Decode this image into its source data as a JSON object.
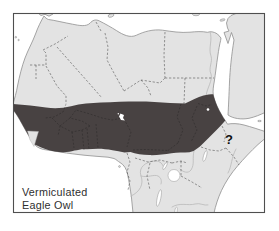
{
  "figure": {
    "species_label": {
      "line1": "Vermiculated",
      "line2": "Eagle Owl"
    },
    "uncertain_marker": "?"
  },
  "colors": {
    "sea": "#ffffff",
    "land": "#e3e3e3",
    "coast": "#8f8f8f",
    "range": "#484242",
    "frame": "#4f4f4f",
    "border": "#4a4a4a",
    "border_on_range": "#141414",
    "river": "#b9b9b9",
    "lake": "#ffffff",
    "label": "#2f2f2f",
    "marker": "#101010"
  }
}
